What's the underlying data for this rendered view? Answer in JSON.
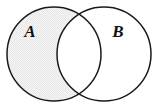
{
  "figure": {
    "kind": "venn-diagram",
    "set_count": 2,
    "background_color": "#ffffff",
    "stroke_color": "#1a1a1a",
    "stroke_width": 1.5,
    "shaded_fill_color": "#f2f2f2",
    "unshaded_fill_color": "#ffffff",
    "shaded_region": "A minus B",
    "intersection_shaded": false,
    "sets": [
      {
        "label": "A",
        "name": "left-set",
        "center_x": 54,
        "center_y": 54,
        "radius": 47,
        "fill": "shaded",
        "label_x": 30,
        "label_y": 37
      },
      {
        "label": "B",
        "name": "right-set",
        "center_x": 104,
        "center_y": 54,
        "radius": 47,
        "fill": "unshaded",
        "label_x": 118,
        "label_y": 37
      }
    ]
  }
}
